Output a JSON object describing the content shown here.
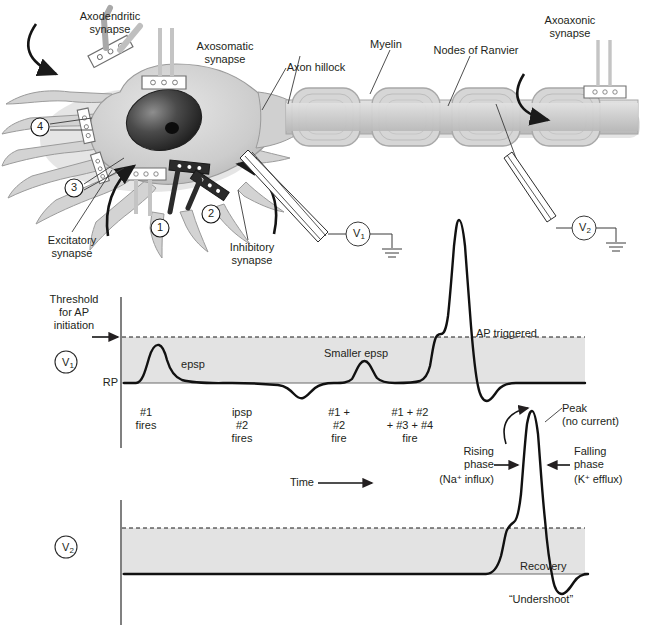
{
  "figure": {
    "neuron": {
      "labels": {
        "axodendritic_synapse": "Axodendritic\nsynapse",
        "axosomatic_synapse": "Axosomatic\nsynapse",
        "axon_hillock": "Axon hillock",
        "myelin": "Myelin",
        "nodes_of_ranvier": "Nodes of Ranvier",
        "axoaxonic_synapse": "Axoaxonic\nsynapse",
        "excitatory_synapse": "Excitatory\nsynapse",
        "inhibitory_synapse": "Inhibitory\nsynapse"
      },
      "callout_numbers": [
        "1",
        "2",
        "3",
        "4"
      ],
      "electrodes": [
        {
          "name": "V1",
          "symbol": "V",
          "subscript": "1"
        },
        {
          "name": "V2",
          "symbol": "V",
          "subscript": "2"
        }
      ]
    },
    "trace_v1": {
      "electrode_label": "V",
      "electrode_sub": "1",
      "threshold_label": "Threshold\nfor AP\ninitiation",
      "rp_label": "RP",
      "annotations": [
        {
          "id": "epsp",
          "text": "epsp"
        },
        {
          "id": "smaller-epsp",
          "text": "Smaller epsp"
        },
        {
          "id": "ap-triggered",
          "text": "AP triggered"
        }
      ],
      "event_labels": [
        {
          "id": "event-1",
          "text": "#1\nfires"
        },
        {
          "id": "event-2",
          "text": "ipsp\n#2\nfires"
        },
        {
          "id": "event-3",
          "text": "#1 +\n#2\nfire"
        },
        {
          "id": "event-4",
          "text": "#1 + #2\n+ #3 + #4\nfire"
        }
      ],
      "time_axis_label": "Time"
    },
    "trace_v2": {
      "electrode_label": "V",
      "electrode_sub": "2",
      "annotations": [
        {
          "id": "peak",
          "text": "Peak\n(no current)"
        },
        {
          "id": "rising-phase",
          "line1": "Rising",
          "line2": "phase",
          "line3_pre": "(Na",
          "line3_sup": "+",
          "line3_post": " influx)"
        },
        {
          "id": "falling-phase",
          "line1": "Falling",
          "line2": "phase",
          "line3_pre": "(K",
          "line3_sup": "+",
          "line3_post": " efflux)"
        },
        {
          "id": "recovery",
          "text": "Recovery"
        },
        {
          "id": "undershoot",
          "text": "“Undershoot”"
        }
      ]
    },
    "colors": {
      "ink": "#231f20",
      "band_fill": "#e3e3e3",
      "cell_fill": "#d8d8d8",
      "cell_stroke": "#9a9a9a",
      "nucleus": "#2a2a2a",
      "axon_fill": "#cfcfcf",
      "white": "#ffffff"
    }
  },
  "chart_data": [
    {
      "type": "line",
      "id": "v1-recording",
      "title": "V1 — membrane potential at soma / axon hillock",
      "xlabel": "Time",
      "ylabel": "Membrane potential",
      "grid": false,
      "legend": "none",
      "reference_lines": [
        {
          "label": "Threshold for AP initiation",
          "style": "dashed",
          "value": 100
        },
        {
          "label": "RP",
          "style": "solid",
          "value": 0
        }
      ],
      "band": {
        "from": 0,
        "to": 100,
        "fill": "#e3e3e3"
      },
      "ylim": [
        -35,
        360
      ],
      "xlim": [
        0,
        100
      ],
      "annotations": [
        "epsp",
        "Smaller epsp",
        "AP triggered"
      ],
      "event_markers": [
        "#1 fires",
        "ipsp #2 fires",
        "#1 + #2 fire",
        "#1 + #2 + #3 + #4 fire"
      ],
      "x": [
        0,
        4,
        8,
        11,
        13,
        16,
        20,
        26,
        33,
        40,
        46,
        50,
        54,
        58,
        62,
        66,
        70,
        73,
        75,
        77,
        79,
        81,
        83,
        85,
        86,
        87,
        88,
        89,
        90,
        92,
        95,
        100
      ],
      "y": [
        0,
        0,
        2,
        30,
        52,
        48,
        36,
        20,
        10,
        5,
        2,
        -2,
        -18,
        -24,
        -12,
        -3,
        0,
        2,
        22,
        30,
        22,
        10,
        4,
        2,
        12,
        95,
        105,
        300,
        340,
        120,
        -28,
        -8
      ]
    },
    {
      "type": "line",
      "id": "v2-recording",
      "title": "V2 — membrane potential at distal axon",
      "xlabel": "Time",
      "ylabel": "Membrane potential",
      "grid": false,
      "legend": "none",
      "reference_lines": [
        {
          "label": "Threshold",
          "style": "dashed",
          "value": 100
        },
        {
          "label": "RP",
          "style": "solid",
          "value": 0
        }
      ],
      "band": {
        "from": 0,
        "to": 100,
        "fill": "#e3e3e3"
      },
      "ylim": [
        -35,
        360
      ],
      "xlim": [
        0,
        100
      ],
      "annotations": [
        "Peak (no current)",
        "Rising phase (Na+ influx)",
        "Falling phase (K+ efflux)",
        "Recovery",
        "“Undershoot”"
      ],
      "x": [
        0,
        20,
        40,
        56,
        62,
        66,
        70,
        73,
        75,
        77,
        79,
        81,
        83,
        85,
        88,
        92,
        96,
        100
      ],
      "y": [
        0,
        0,
        0,
        0,
        2,
        20,
        95,
        105,
        300,
        345,
        340,
        200,
        -5,
        -30,
        -22,
        -6,
        -2,
        -2
      ]
    }
  ]
}
